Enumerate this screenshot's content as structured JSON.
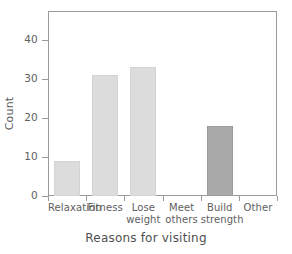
{
  "chart_data": {
    "type": "bar",
    "title": "",
    "xlabel": "Reasons for visiting",
    "ylabel": "Count",
    "categories": [
      "Relaxation",
      "Fitness",
      "Lose weight",
      "Meet others",
      "Build strength",
      "Other"
    ],
    "category_lines": [
      [
        "Relaxation",
        ""
      ],
      [
        "Fitness",
        ""
      ],
      [
        "Lose",
        "weight"
      ],
      [
        "Meet",
        "others"
      ],
      [
        "Build",
        "strength"
      ],
      [
        "Other",
        ""
      ]
    ],
    "values": [
      9,
      31,
      33,
      0,
      18,
      0
    ],
    "ylim": [
      0,
      47.5
    ],
    "yticks": [
      0,
      10,
      20,
      30,
      40
    ],
    "ytick_labels": [
      "0",
      "10",
      "20",
      "30",
      "40"
    ],
    "grid": false,
    "legend": "none",
    "bar_colors": [
      "#dcdcdc",
      "#dcdcdc",
      "#dcdcdc",
      "#dcdcdc",
      "#a9a9a9",
      "#dcdcdc"
    ],
    "frame_color": "#9a9a9c",
    "text_color": "#5a5a5c"
  }
}
